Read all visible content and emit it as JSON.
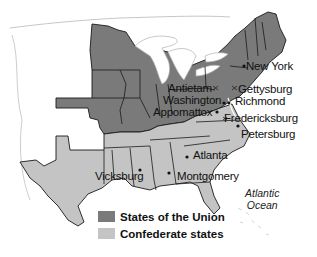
{
  "map": {
    "colors": {
      "union": "#7a7a7a",
      "confederate": "#c4c4c4",
      "border": "#1a1a1a",
      "background": "#ffffff",
      "outline": "#b0b0b0"
    },
    "cities": [
      {
        "name": "New York",
        "x": 246,
        "y": 62
      },
      {
        "name": "Antietam",
        "x": 168,
        "y": 86
      },
      {
        "name": "Gettysburg",
        "x": 238,
        "y": 86
      },
      {
        "name": "Washington",
        "x": 163,
        "y": 98
      },
      {
        "name": "Richmond",
        "x": 235,
        "y": 98
      },
      {
        "name": "Appomattox",
        "x": 153,
        "y": 109
      },
      {
        "name": "Fredericksburg",
        "x": 224,
        "y": 115
      },
      {
        "name": "Petersburg",
        "x": 241,
        "y": 130
      },
      {
        "name": "Atlanta",
        "x": 194,
        "y": 151
      },
      {
        "name": "Vicksburg",
        "x": 95,
        "y": 171
      },
      {
        "name": "Montgomery",
        "x": 177,
        "y": 172
      }
    ],
    "ocean_label": [
      "Atlantic",
      "Ocean"
    ]
  },
  "legend": {
    "items": [
      {
        "label": "States of the Union",
        "color": "#7a7a7a"
      },
      {
        "label": "Confederate states",
        "color": "#c4c4c4"
      }
    ]
  }
}
